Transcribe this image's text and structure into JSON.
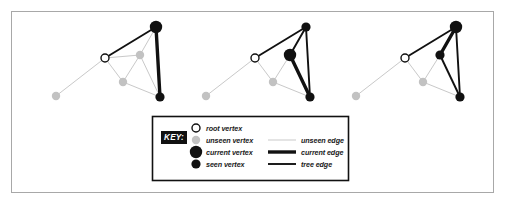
{
  "figure": {
    "border_color": "#a8a8a8",
    "background": "#ffffff"
  },
  "colors": {
    "unseen": "#c2c2c2",
    "unseen_edge": "#c9c9c9",
    "current": "#111111",
    "seen": "#111111",
    "tree_edge": "#111111",
    "current_edge": "#111111",
    "root_fill": "#ffffff",
    "root_stroke": "#111111",
    "key_badge_bg": "#111111",
    "key_badge_fg": "#ffffff",
    "legend_border": "#111111"
  },
  "legend": {
    "badge_label": "KEY:",
    "vertex_items": [
      {
        "label": "root vertex",
        "marker": "root-vertex-marker"
      },
      {
        "label": "unseen vertex",
        "marker": "unseen-vertex-marker"
      },
      {
        "label": "current vertex",
        "marker": "current-vertex-marker"
      },
      {
        "label": "seen vertex",
        "marker": "seen-vertex-marker"
      }
    ],
    "edge_items": [
      {
        "label": "unseen edge",
        "marker": "unseen-edge-marker"
      },
      {
        "label": "current edge",
        "marker": "current-edge-marker"
      },
      {
        "label": "tree edge",
        "marker": "tree-edge-marker"
      }
    ]
  },
  "panels": [
    {
      "name": "panel-1",
      "offset_x": 0,
      "vertices": [
        {
          "id": "far-left",
          "x": 56,
          "y": 96,
          "state": "unseen"
        },
        {
          "id": "root",
          "x": 105,
          "y": 58,
          "state": "root"
        },
        {
          "id": "low-mid",
          "x": 123,
          "y": 82,
          "state": "unseen"
        },
        {
          "id": "mid-right",
          "x": 140,
          "y": 55,
          "state": "unseen"
        },
        {
          "id": "top",
          "x": 156,
          "y": 27,
          "state": "current"
        },
        {
          "id": "bottom-right",
          "x": 160,
          "y": 97,
          "state": "seen"
        }
      ],
      "edges": [
        {
          "from": "far-left",
          "to": "root",
          "state": "unseen"
        },
        {
          "from": "root",
          "to": "low-mid",
          "state": "unseen"
        },
        {
          "from": "root",
          "to": "mid-right",
          "state": "unseen"
        },
        {
          "from": "low-mid",
          "to": "mid-right",
          "state": "unseen"
        },
        {
          "from": "low-mid",
          "to": "bottom-right",
          "state": "unseen"
        },
        {
          "from": "mid-right",
          "to": "top",
          "state": "unseen"
        },
        {
          "from": "mid-right",
          "to": "bottom-right",
          "state": "unseen"
        },
        {
          "from": "root",
          "to": "top",
          "state": "tree"
        },
        {
          "from": "top",
          "to": "bottom-right",
          "state": "current"
        }
      ]
    },
    {
      "name": "panel-2",
      "offset_x": 150,
      "vertices": [
        {
          "id": "far-left",
          "x": 56,
          "y": 96,
          "state": "unseen"
        },
        {
          "id": "root",
          "x": 105,
          "y": 58,
          "state": "root"
        },
        {
          "id": "low-mid",
          "x": 123,
          "y": 82,
          "state": "unseen"
        },
        {
          "id": "mid-right",
          "x": 140,
          "y": 55,
          "state": "current"
        },
        {
          "id": "top",
          "x": 156,
          "y": 27,
          "state": "seen"
        },
        {
          "id": "bottom-right",
          "x": 160,
          "y": 97,
          "state": "seen"
        }
      ],
      "edges": [
        {
          "from": "far-left",
          "to": "root",
          "state": "unseen"
        },
        {
          "from": "root",
          "to": "low-mid",
          "state": "unseen"
        },
        {
          "from": "low-mid",
          "to": "mid-right",
          "state": "unseen"
        },
        {
          "from": "low-mid",
          "to": "bottom-right",
          "state": "unseen"
        },
        {
          "from": "root",
          "to": "top",
          "state": "tree"
        },
        {
          "from": "top",
          "to": "bottom-right",
          "state": "tree"
        },
        {
          "from": "mid-right",
          "to": "top",
          "state": "tree"
        },
        {
          "from": "mid-right",
          "to": "bottom-right",
          "state": "current"
        }
      ]
    },
    {
      "name": "panel-3",
      "offset_x": 300,
      "vertices": [
        {
          "id": "far-left",
          "x": 56,
          "y": 96,
          "state": "unseen"
        },
        {
          "id": "root",
          "x": 105,
          "y": 58,
          "state": "root"
        },
        {
          "id": "low-mid",
          "x": 123,
          "y": 82,
          "state": "unseen"
        },
        {
          "id": "mid-right",
          "x": 140,
          "y": 55,
          "state": "seen"
        },
        {
          "id": "top",
          "x": 156,
          "y": 27,
          "state": "current"
        },
        {
          "id": "bottom-right",
          "x": 160,
          "y": 97,
          "state": "seen"
        }
      ],
      "edges": [
        {
          "from": "far-left",
          "to": "root",
          "state": "unseen"
        },
        {
          "from": "root",
          "to": "low-mid",
          "state": "unseen"
        },
        {
          "from": "low-mid",
          "to": "mid-right",
          "state": "unseen"
        },
        {
          "from": "low-mid",
          "to": "bottom-right",
          "state": "unseen"
        },
        {
          "from": "root",
          "to": "top",
          "state": "tree"
        },
        {
          "from": "mid-right",
          "to": "bottom-right",
          "state": "tree"
        },
        {
          "from": "top",
          "to": "bottom-right",
          "state": "tree"
        },
        {
          "from": "mid-right",
          "to": "top",
          "state": "current"
        }
      ]
    }
  ],
  "geometry": {
    "border": {
      "x": 11,
      "y": 11,
      "w": 482,
      "h": 181
    },
    "legend_box": {
      "x": 152,
      "y": 116,
      "w": 196,
      "h": 64
    },
    "badge": {
      "x": 161,
      "y": 131,
      "w": 26,
      "h": 13
    },
    "vertex_col_x": 196,
    "vertex_label_x": 206,
    "edge_line_x1": 268,
    "edge_line_x2": 296,
    "edge_label_x": 301,
    "row_ys": [
      128,
      140,
      152,
      164
    ],
    "edge_row_ys": [
      140,
      152,
      164
    ]
  },
  "sizes": {
    "r_unseen": 4.2,
    "r_root": 4.0,
    "r_current": 6.2,
    "r_seen": 4.6,
    "w_unseen_edge": 1.0,
    "w_tree_edge": 1.9,
    "w_current_edge": 3.4
  }
}
